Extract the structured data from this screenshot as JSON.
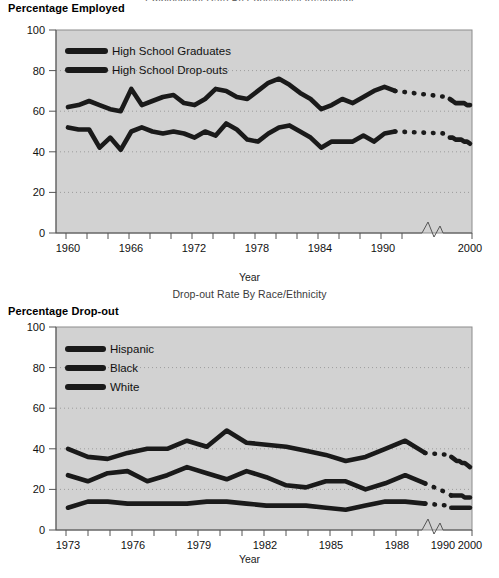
{
  "page": {
    "background": "#ffffff",
    "ink": "#000000",
    "plot_fill": "#d2d2d2",
    "grid_color": "#9a9a9a",
    "series_color": "#1a1a1a"
  },
  "figure1": {
    "top_title_clipped": "Employment Rate By Educational Attainment",
    "axis_title": "Percentage Employed",
    "xlabel": "Year",
    "ylabel": "",
    "legend": [
      {
        "label": "High School Graduates",
        "color": "#1a1a1a"
      },
      {
        "label": "High School Drop-outs",
        "color": "#1a1a1a"
      }
    ],
    "yticks": [
      "0",
      "20",
      "40",
      "60",
      "80",
      "100"
    ],
    "xticks": [
      "1960",
      "1966",
      "1972",
      "1978",
      "1984",
      "1990",
      "2000"
    ],
    "axis_break": true
  },
  "figure2": {
    "title": "Drop-out Rate By Race/Ethnicity",
    "axis_title": "Percentage Drop-out",
    "xlabel": "Year",
    "legend": [
      {
        "label": "Hispanic",
        "color": "#1a1a1a"
      },
      {
        "label": "Black",
        "color": "#1a1a1a"
      },
      {
        "label": "White",
        "color": "#1a1a1a"
      }
    ],
    "yticks": [
      "0",
      "20",
      "40",
      "60",
      "80",
      "100"
    ],
    "xticks": [
      "1973",
      "1976",
      "1979",
      "1982",
      "1985",
      "1988",
      "1990",
      "2000"
    ],
    "axis_break": true
  },
  "chart_data": [
    {
      "type": "line",
      "title": "Employment Rate By Educational Attainment",
      "subtitle": "Percentage Employed",
      "xlabel": "Year",
      "ylabel": "Percentage Employed",
      "ylim": [
        0,
        100
      ],
      "xlim": [
        1960,
        2000
      ],
      "grid": true,
      "legend_position": "top-left",
      "axis_break_after": 1991,
      "x": [
        1960,
        1961,
        1962,
        1963,
        1964,
        1965,
        1966,
        1967,
        1968,
        1969,
        1970,
        1971,
        1972,
        1973,
        1974,
        1975,
        1976,
        1977,
        1978,
        1979,
        1980,
        1981,
        1982,
        1983,
        1984,
        1985,
        1986,
        1987,
        1988,
        1989,
        1990,
        1991,
        1992,
        1993,
        1994,
        1995,
        1996,
        1997,
        1998,
        1999,
        2000
      ],
      "series": [
        {
          "name": "High School Graduates",
          "values": [
            62,
            63,
            65,
            63,
            61,
            60,
            71,
            63,
            65,
            67,
            68,
            64,
            63,
            66,
            71,
            70,
            67,
            66,
            70,
            74,
            76,
            73,
            69,
            66,
            61,
            63,
            66,
            64,
            67,
            70,
            72,
            70,
            67,
            66,
            65,
            64,
            64,
            64,
            64,
            63,
            63
          ],
          "dashed_from": 1991
        },
        {
          "name": "High School Drop-outs",
          "values": [
            52,
            51,
            51,
            42,
            47,
            41,
            50,
            52,
            50,
            49,
            50,
            49,
            47,
            50,
            48,
            54,
            51,
            46,
            45,
            49,
            52,
            53,
            50,
            47,
            42,
            45,
            45,
            45,
            48,
            45,
            49,
            50,
            49,
            47,
            47,
            46,
            46,
            46,
            45,
            45,
            44
          ],
          "dashed_from": 1991
        }
      ]
    },
    {
      "type": "line",
      "title": "Drop-out Rate By Race/Ethnicity",
      "subtitle": "Percentage Drop-out",
      "xlabel": "Year",
      "ylabel": "Percentage Drop-out",
      "ylim": [
        0,
        100
      ],
      "xlim": [
        1973,
        2000
      ],
      "grid": true,
      "legend_position": "top-left",
      "axis_break_after": 1991,
      "x": [
        1973,
        1974,
        1975,
        1976,
        1977,
        1978,
        1979,
        1980,
        1981,
        1982,
        1983,
        1984,
        1985,
        1986,
        1987,
        1988,
        1989,
        1990,
        1991,
        1992,
        1993,
        1994,
        1995,
        1996,
        1997,
        1998,
        1999,
        2000
      ],
      "series": [
        {
          "name": "Hispanic",
          "values": [
            40,
            36,
            35,
            38,
            40,
            40,
            44,
            41,
            49,
            43,
            42,
            41,
            39,
            37,
            34,
            36,
            40,
            44,
            38,
            37,
            36,
            35,
            34,
            34,
            33,
            33,
            32,
            31
          ],
          "dashed_from": 1991
        },
        {
          "name": "Black",
          "values": [
            27,
            24,
            28,
            29,
            24,
            27,
            31,
            28,
            25,
            29,
            26,
            22,
            21,
            24,
            24,
            20,
            23,
            27,
            23,
            18,
            17,
            17,
            17,
            17,
            17,
            16,
            16,
            16
          ],
          "dashed_from": 1991
        },
        {
          "name": "White",
          "values": [
            11,
            14,
            14,
            13,
            13,
            13,
            13,
            14,
            14,
            13,
            12,
            12,
            12,
            11,
            10,
            12,
            14,
            14,
            13,
            12,
            11,
            11,
            11,
            11,
            11,
            11,
            11,
            11
          ],
          "dashed_from": 1991
        }
      ]
    }
  ]
}
